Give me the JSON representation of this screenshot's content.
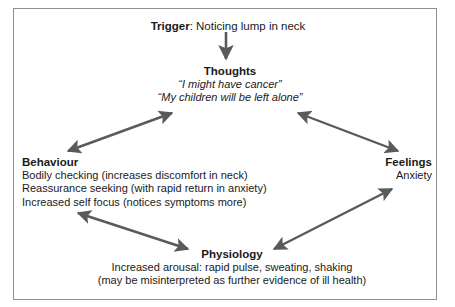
{
  "diagram": {
    "frame": {
      "border_color": "#8e8e93",
      "background": "#ffffff"
    },
    "arrow_color": "#5a5a5a",
    "text_color": "#1a1a1a",
    "nodes": {
      "trigger": {
        "heading": "Trigger",
        "separator": ": ",
        "description": "Noticing lump in neck"
      },
      "thoughts": {
        "heading": "Thoughts",
        "lines": [
          "“I might have cancer”",
          "“My children will be left alone”"
        ]
      },
      "behaviour": {
        "heading": "Behaviour",
        "lines": [
          "Bodily checking (increases discomfort in neck)",
          "Reassurance seeking (with rapid return in anxiety)",
          "Increased self focus (notices symptoms more)"
        ]
      },
      "feelings": {
        "heading": "Feelings",
        "lines": [
          "Anxiety"
        ]
      },
      "physiology": {
        "heading": "Physiology",
        "lines": [
          "Increased arousal: rapid pulse, sweating, shaking",
          "(may be misinterpreted as further evidence of ill health)"
        ]
      }
    },
    "arrows": [
      {
        "name": "trigger-to-thoughts",
        "from": "trigger",
        "to": "thoughts",
        "heads": "single-down"
      },
      {
        "name": "thoughts-to-behaviour",
        "from": "thoughts",
        "to": "behaviour",
        "heads": "double"
      },
      {
        "name": "thoughts-to-feelings",
        "from": "thoughts",
        "to": "feelings",
        "heads": "double"
      },
      {
        "name": "behaviour-to-physiology",
        "from": "behaviour",
        "to": "physiology",
        "heads": "double"
      },
      {
        "name": "feelings-to-physiology",
        "from": "feelings",
        "to": "physiology",
        "heads": "double"
      }
    ]
  }
}
